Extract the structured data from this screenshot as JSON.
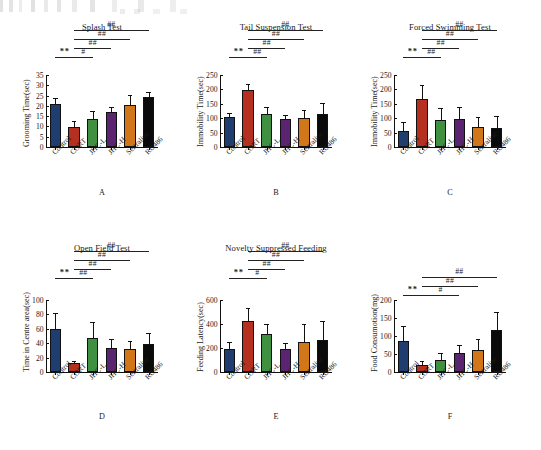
{
  "figure": {
    "groups": [
      "Control",
      "CORT",
      "JHC-L",
      "JHC-H",
      "Sertraline",
      "RU486"
    ],
    "group_colors": [
      "#1f3d6e",
      "#b5301f",
      "#3f9040",
      "#5a2470",
      "#d2761a",
      "#0a0a0a"
    ],
    "star_marker": "**",
    "hash_single": "#",
    "hash_double": "##"
  },
  "chart_data": [
    {
      "type": "bar",
      "panel": "A",
      "title": "Splash Test",
      "xlabel": "",
      "ylabel": "Grooming Time(sec)",
      "categories": [
        "Control",
        "CORT",
        "JHC-L",
        "JHC-H",
        "Sertraline",
        "RU486"
      ],
      "values": [
        20.8,
        9.6,
        13.8,
        17.0,
        20.3,
        24.4
      ],
      "errors": [
        2.6,
        2.4,
        3.3,
        2.1,
        4.3,
        1.9
      ],
      "ylim": [
        0,
        35
      ],
      "yticks": [
        0,
        5,
        10,
        15,
        20,
        25,
        30,
        35
      ],
      "grid": false,
      "annotations": [
        {
          "from": "Control",
          "to": "CORT",
          "label": "**",
          "level": 0,
          "type": "star"
        },
        {
          "from": "CORT",
          "to": "JHC-L",
          "label": "#",
          "level": 1,
          "type": "hash"
        },
        {
          "from": "CORT",
          "to": "JHC-H",
          "label": "##",
          "level": 2,
          "type": "hash"
        },
        {
          "from": "CORT",
          "to": "Sertraline",
          "label": "##",
          "level": 3,
          "type": "hash"
        },
        {
          "from": "CORT",
          "to": "RU486",
          "label": "##",
          "level": 4,
          "type": "hash"
        }
      ]
    },
    {
      "type": "bar",
      "panel": "B",
      "title": "Tail Suspension Test",
      "xlabel": "",
      "ylabel": "Immobility Time(sec)",
      "categories": [
        "Control",
        "CORT",
        "JHC-L",
        "JHC-H",
        "Sertraline",
        "RU486"
      ],
      "values": [
        103,
        199,
        114,
        96,
        101,
        114
      ],
      "errors": [
        13,
        16,
        22,
        12,
        24,
        34
      ],
      "ylim": [
        0,
        250
      ],
      "yticks": [
        0,
        50,
        100,
        150,
        200,
        250
      ],
      "grid": false,
      "annotations": [
        {
          "from": "Control",
          "to": "CORT",
          "label": "**",
          "level": 0,
          "type": "star"
        },
        {
          "from": "CORT",
          "to": "JHC-L",
          "label": "##",
          "level": 1,
          "type": "hash"
        },
        {
          "from": "CORT",
          "to": "JHC-H",
          "label": "##",
          "level": 2,
          "type": "hash"
        },
        {
          "from": "CORT",
          "to": "Sertraline",
          "label": "##",
          "level": 3,
          "type": "hash"
        },
        {
          "from": "CORT",
          "to": "RU486",
          "label": "##",
          "level": 4,
          "type": "hash"
        }
      ]
    },
    {
      "type": "bar",
      "panel": "C",
      "title": "Forced Swimming Test",
      "xlabel": "",
      "ylabel": "Immobility Time(sec)",
      "categories": [
        "Control",
        "CORT",
        "JHC-L",
        "JHC-H",
        "Sertraline",
        "RU486"
      ],
      "values": [
        57,
        168,
        94,
        96,
        69,
        67
      ],
      "errors": [
        26,
        45,
        38,
        39,
        31,
        36
      ],
      "ylim": [
        0,
        250
      ],
      "yticks": [
        0,
        50,
        100,
        150,
        200,
        250
      ],
      "grid": false,
      "annotations": [
        {
          "from": "Control",
          "to": "CORT",
          "label": "**",
          "level": 0,
          "type": "star"
        },
        {
          "from": "CORT",
          "to": "JHC-L",
          "label": "##",
          "level": 1,
          "type": "hash"
        },
        {
          "from": "CORT",
          "to": "JHC-H",
          "label": "##",
          "level": 2,
          "type": "hash"
        },
        {
          "from": "CORT",
          "to": "Sertraline",
          "label": "##",
          "level": 3,
          "type": "hash"
        },
        {
          "from": "CORT",
          "to": "RU486",
          "label": "##",
          "level": 4,
          "type": "hash"
        }
      ]
    },
    {
      "type": "bar",
      "panel": "D",
      "title": "Open Field Test",
      "xlabel": "",
      "ylabel": "Time in Centre area(sec)",
      "categories": [
        "Control",
        "CORT",
        "JHC-L",
        "JHC-H",
        "Sertraline",
        "RU486"
      ],
      "values": [
        60,
        12,
        47,
        34,
        32,
        39
      ],
      "errors": [
        21,
        2.5,
        21,
        10,
        10,
        14
      ],
      "ylim": [
        0,
        100
      ],
      "yticks": [
        0,
        20,
        40,
        60,
        80,
        100
      ],
      "grid": false,
      "annotations": [
        {
          "from": "Control",
          "to": "CORT",
          "label": "**",
          "level": 0,
          "type": "star"
        },
        {
          "from": "CORT",
          "to": "JHC-L",
          "label": "##",
          "level": 1,
          "type": "hash"
        },
        {
          "from": "CORT",
          "to": "JHC-H",
          "label": "##",
          "level": 2,
          "type": "hash"
        },
        {
          "from": "CORT",
          "to": "Sertraline",
          "label": "##",
          "level": 3,
          "type": "hash"
        },
        {
          "from": "CORT",
          "to": "RU486",
          "label": "##",
          "level": 4,
          "type": "hash"
        }
      ]
    },
    {
      "type": "bar",
      "panel": "E",
      "title": "Novelty Suppressed Feeding",
      "xlabel": "",
      "ylabel": "Feeding Latency(sec)",
      "categories": [
        "Control",
        "CORT",
        "JHC-L",
        "JHC-H",
        "Sertraline",
        "RU486"
      ],
      "values": [
        191,
        423,
        320,
        190,
        254,
        266
      ],
      "errors": [
        53,
        105,
        68,
        44,
        136,
        148
      ],
      "ylim": [
        0,
        600
      ],
      "yticks": [
        0,
        200,
        400,
        600
      ],
      "grid": false,
      "annotations": [
        {
          "from": "Control",
          "to": "CORT",
          "label": "**",
          "level": 0,
          "type": "star"
        },
        {
          "from": "CORT",
          "to": "JHC-L",
          "label": "#",
          "level": 1,
          "type": "hash"
        },
        {
          "from": "CORT",
          "to": "JHC-H",
          "label": "##",
          "level": 2,
          "type": "hash"
        },
        {
          "from": "CORT",
          "to": "Sertraline",
          "label": "##",
          "level": 3,
          "type": "hash"
        },
        {
          "from": "CORT",
          "to": "RU486",
          "label": "##",
          "level": 4,
          "type": "hash"
        }
      ]
    },
    {
      "type": "bar",
      "panel": "F",
      "title": "",
      "xlabel": "",
      "ylabel": "Food Consumotion(mg)",
      "categories": [
        "Control",
        "CORT",
        "JHC-L",
        "JHC-H",
        "Sertraline",
        "RU486"
      ],
      "values": [
        87,
        19,
        33,
        53,
        62,
        118
      ],
      "errors": [
        37,
        10,
        18,
        20,
        28,
        45
      ],
      "ylim": [
        0,
        200
      ],
      "yticks": [
        0,
        50,
        100,
        150,
        200
      ],
      "grid": false,
      "annotations": [
        {
          "from": "Control",
          "to": "CORT",
          "label": "**",
          "level": 0,
          "type": "star"
        },
        {
          "from": "CORT",
          "to": "JHC-H",
          "label": "#",
          "level": 1,
          "type": "hash"
        },
        {
          "from": "CORT",
          "to": "Sertraline",
          "label": "##",
          "level": 2,
          "type": "hash"
        },
        {
          "from": "CORT",
          "to": "RU486",
          "label": "##",
          "level": 3,
          "type": "hash"
        }
      ]
    }
  ]
}
